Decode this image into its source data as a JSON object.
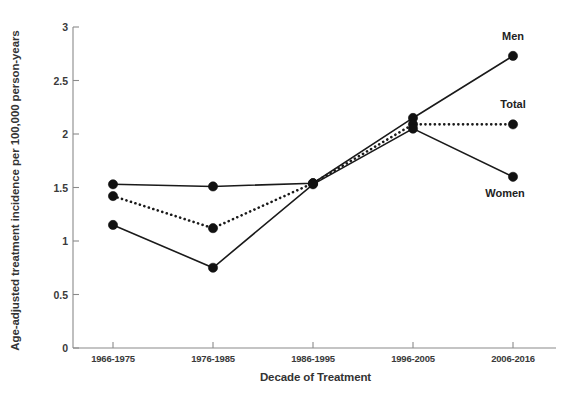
{
  "chart_data": {
    "type": "line",
    "title": "",
    "xlabel": "Decade of Treatment",
    "ylabel": "Age-adjusted treatment incidence per 100,000 person-years",
    "categories": [
      "1966-1975",
      "1976-1985",
      "1986-1995",
      "1996-2005",
      "2006-2016"
    ],
    "ylim": [
      0,
      3
    ],
    "yticks": [
      "0",
      "0.5",
      "1",
      "1.5",
      "2",
      "2.5",
      "3"
    ],
    "ytick_values": [
      0,
      0.5,
      1,
      1.5,
      2,
      2.5,
      3
    ],
    "grid": false,
    "legend_position": "right-inline-labels",
    "series": [
      {
        "name": "Men",
        "style": "solid",
        "marker": "filled-circle",
        "values": [
          1.53,
          1.51,
          1.54,
          2.15,
          2.73
        ]
      },
      {
        "name": "Total",
        "style": "dotted",
        "marker": "filled-circle",
        "values": [
          1.42,
          1.12,
          1.54,
          2.09,
          2.09
        ]
      },
      {
        "name": "Women",
        "style": "solid",
        "marker": "filled-circle",
        "values": [
          1.15,
          0.75,
          1.53,
          2.05,
          1.6
        ]
      }
    ],
    "annotations": [
      {
        "text": "Men",
        "series": "Men"
      },
      {
        "text": "Total",
        "series": "Total"
      },
      {
        "text": "Women",
        "series": "Women"
      }
    ],
    "colors": {
      "line": "#1a1a1a",
      "marker": "#111111",
      "axis": "#8a8a8a",
      "text": "#333333",
      "background": "#ffffff"
    }
  }
}
